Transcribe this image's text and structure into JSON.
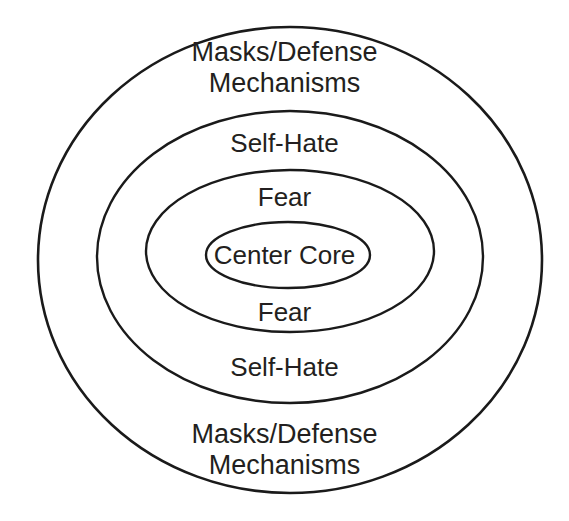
{
  "diagram": {
    "type": "concentric-ellipses",
    "background_color": "#ffffff",
    "stroke_color": "#1a1a1a",
    "text_color": "#231f20",
    "rings": [
      {
        "id": "outer",
        "label_top": "Masks/Defense\nMechanisms",
        "label_bottom": "Masks/Defense\nMechanisms",
        "cx": 290,
        "cy": 260,
        "rx": 252,
        "ry": 233,
        "stroke_width": 2.6
      },
      {
        "id": "second",
        "label_top": "Self-Hate",
        "label_bottom": "Self-Hate",
        "cx": 290,
        "cy": 257,
        "rx": 193,
        "ry": 146,
        "stroke_width": 2.4
      },
      {
        "id": "third",
        "label_top": "Fear",
        "label_bottom": "Fear",
        "cx": 290,
        "cy": 251,
        "rx": 144,
        "ry": 81,
        "stroke_width": 2.4
      },
      {
        "id": "core",
        "label_top": "Center Core",
        "label_bottom": "",
        "cx": 288,
        "cy": 255,
        "rx": 82,
        "ry": 33,
        "stroke_width": 2.4
      }
    ],
    "labels": {
      "outer_top": "Masks/Defense\nMechanisms",
      "mid_top": "Self-Hate",
      "inner_top": "Fear",
      "core": "Center Core",
      "inner_bottom": "Fear",
      "mid_bottom": "Self-Hate",
      "outer_bottom": "Masks/Defense\nMechanisms"
    }
  }
}
